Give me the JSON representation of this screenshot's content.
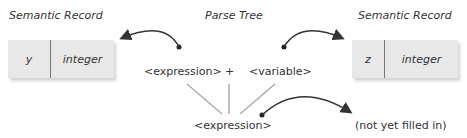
{
  "labels": {
    "left_record_title": "Semantic Record",
    "parse_tree_title": "Parse Tree",
    "right_record_title": "Semantic Record"
  },
  "left_record": {
    "name": "y",
    "type": "integer"
  },
  "right_record": {
    "name": "z",
    "type": "integer"
  },
  "parse_tree": {
    "left_child": "<expression>",
    "operator": "+",
    "right_child": "<variable>",
    "root": "<expression>"
  },
  "unfilled_note": "(not yet filled in)",
  "colors": {
    "record_bg": "#e8e8e8",
    "tree_line": "#aaaaaa",
    "arrow": "#333333"
  }
}
